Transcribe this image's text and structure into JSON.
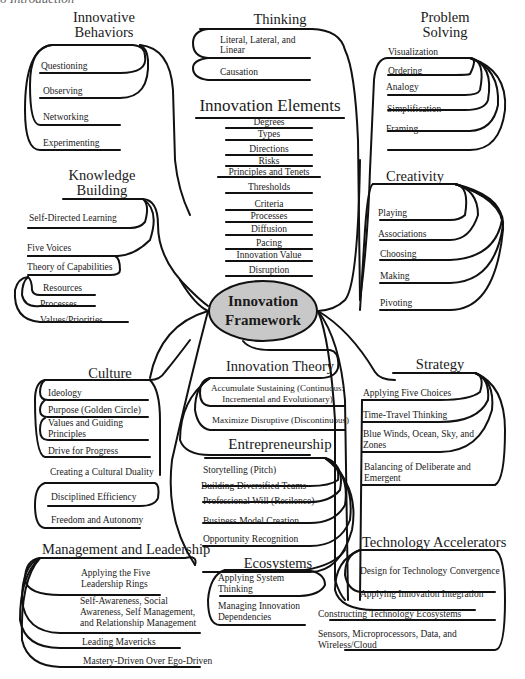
{
  "page_header": "6 Introduction",
  "center": {
    "title_line1": "Innovation",
    "title_line2": "Framework",
    "fill": "#c8c8c8"
  },
  "innovative_behaviors": {
    "title_line1": "Innovative",
    "title_line2": "Behaviors",
    "items": [
      "Questioning",
      "Observing",
      "Networking",
      "Experimenting"
    ]
  },
  "thinking": {
    "title": "Thinking",
    "items": [
      "Literal, Lateral, and",
      "Linear",
      "Causation"
    ]
  },
  "problem_solving": {
    "title_line1": "Problem",
    "title_line2": "Solving",
    "items": [
      "Visualization",
      "Ordering",
      "Analogy",
      "Simplification",
      "Framing"
    ]
  },
  "innovation_elements": {
    "title": "Innovation Elements",
    "items": [
      "Degrees",
      "Types",
      "Directions",
      "Risks",
      "Principles and Tenets",
      "Thresholds",
      "Criteria",
      "Processes",
      "Diffusion",
      "Pacing",
      "Innovation Value",
      "Disruption"
    ]
  },
  "knowledge_building": {
    "title_line1": "Knowledge",
    "title_line2": "Building",
    "items": [
      "Self-Directed Learning",
      "Five Voices",
      "Theory of Capabilities",
      "Resources",
      "Processes",
      "Values/Priorities"
    ]
  },
  "creativity": {
    "title": "Creativity",
    "items": [
      "Playing",
      "Associations",
      "Choosing",
      "Making",
      "Pivoting"
    ]
  },
  "culture": {
    "title": "Culture",
    "items": [
      "Ideology",
      "Purpose (Golden Circle)",
      "Values and Guiding",
      "Principles",
      "Drive for Progress",
      "Creating a Cultural Duality",
      "Disciplined Efficiency",
      "Freedom and Autonomy"
    ]
  },
  "innovation_theory": {
    "title": "Innovation Theory",
    "items": [
      "Accumulate Sustaining (Continuous:",
      "Incremental and Evolutionary)",
      "Maximize Disruptive (Discontinuous)"
    ]
  },
  "strategy": {
    "title": "Strategy",
    "items": [
      "Applying Five Choices",
      "Time-Travel Thinking",
      "Blue Winds, Ocean, Sky, and",
      "Zones",
      "Balancing of Deliberate and",
      "Emergent"
    ]
  },
  "entrepreneurship": {
    "title": "Entrepreneurship",
    "items": [
      "Storytelling (Pitch)",
      "Building Diversified Teams",
      "Professional Will (Resilence)",
      "Business Model Creation",
      "Opportunity Recognition"
    ]
  },
  "management_leadership": {
    "title": "Management and Leadership",
    "items": [
      "Applying the Five",
      "Leadership Rings",
      "Self-Awareness, Social",
      "Awareness, Self Management,",
      "and Relationship Management",
      "Leading Mavericks",
      "Mastery-Driven Over Ego-Driven"
    ]
  },
  "ecosystems": {
    "title": "Ecosystems",
    "items": [
      "Applying System",
      "Thinking",
      "Managing Innovation",
      "Dependencies"
    ]
  },
  "technology_accelerators": {
    "title": "Technology Accelerators",
    "items": [
      "Design for Technology Convergence",
      "Applying Innovation Integration",
      "Constructing Technology Ecosystems",
      "Sensors, Microprocessors, Data, and",
      "Wireless/Cloud"
    ]
  }
}
